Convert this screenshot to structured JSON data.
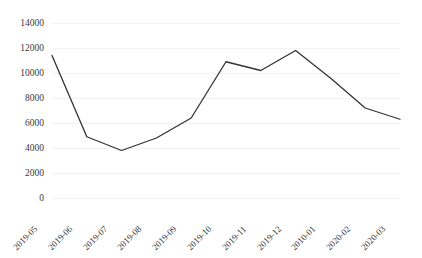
{
  "chart_data": {
    "type": "line",
    "title": "",
    "subtitle": "",
    "xlabel": "",
    "ylabel": "",
    "categories": [
      "2019-05",
      "2019-06",
      "2019-07",
      "2019-08",
      "2019-09",
      "2019-10",
      "2019-11",
      "2019-12",
      "2010-01",
      "2020-02",
      "2020-03"
    ],
    "values": [
      11400,
      4900,
      3800,
      4800,
      6400,
      10900,
      10200,
      11800,
      9600,
      7200,
      6300
    ],
    "series": [
      {
        "name": "",
        "values": [
          11400,
          4900,
          3800,
          4800,
          6400,
          10900,
          10200,
          11800,
          9600,
          7200,
          6300
        ]
      }
    ],
    "ylim": [
      0,
      14000
    ],
    "ytick_values": [
      0,
      2000,
      4000,
      6000,
      8000,
      10000,
      12000,
      14000
    ],
    "ytick_labels": [
      "0",
      "2000",
      "4000",
      "6000",
      "8000",
      "10000",
      "12000",
      "14000"
    ],
    "grid": true,
    "grid_axis": "y",
    "legend": false,
    "legend_position": "none",
    "line_color": "#333333",
    "gridline_color": "#f2f2f2",
    "background_color": "#ffffff",
    "markers": false,
    "annotations": []
  }
}
